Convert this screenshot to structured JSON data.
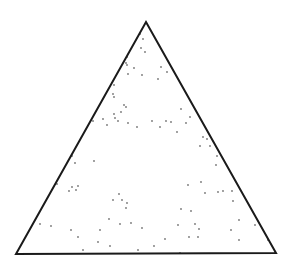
{
  "diagram": {
    "type": "triangle-scatter",
    "background": "#ffffff",
    "stroke_color": "#1a1a1a",
    "dot_color": "#777777",
    "triangle": {
      "apex": [
        146,
        22
      ],
      "left": [
        16,
        254
      ],
      "right": [
        276,
        253
      ]
    },
    "points": [
      [
        140,
        34
      ],
      [
        143,
        39
      ],
      [
        141,
        48
      ],
      [
        145,
        52
      ],
      [
        127,
        57
      ],
      [
        127,
        65
      ],
      [
        126,
        63
      ],
      [
        134,
        68
      ],
      [
        128,
        74
      ],
      [
        142,
        75
      ],
      [
        161,
        67
      ],
      [
        167,
        72
      ],
      [
        158,
        79
      ],
      [
        114,
        85
      ],
      [
        113,
        94
      ],
      [
        114,
        97
      ],
      [
        124,
        105
      ],
      [
        126,
        107
      ],
      [
        121,
        112
      ],
      [
        114,
        114
      ],
      [
        115,
        118
      ],
      [
        93,
        121
      ],
      [
        103,
        119
      ],
      [
        107,
        125
      ],
      [
        118,
        121
      ],
      [
        128,
        123
      ],
      [
        137,
        127
      ],
      [
        152,
        121
      ],
      [
        160,
        127
      ],
      [
        166,
        121
      ],
      [
        171,
        122
      ],
      [
        181,
        109
      ],
      [
        190,
        117
      ],
      [
        186,
        123
      ],
      [
        177,
        132
      ],
      [
        203,
        137
      ],
      [
        207,
        139
      ],
      [
        200,
        146
      ],
      [
        210,
        146
      ],
      [
        217,
        156
      ],
      [
        216,
        165
      ],
      [
        72,
        156
      ],
      [
        75,
        163
      ],
      [
        94,
        161
      ],
      [
        57,
        184
      ],
      [
        72,
        187
      ],
      [
        69,
        191
      ],
      [
        76,
        190
      ],
      [
        78,
        186
      ],
      [
        119,
        194
      ],
      [
        113,
        200
      ],
      [
        122,
        200
      ],
      [
        127,
        203
      ],
      [
        126,
        208
      ],
      [
        188,
        185
      ],
      [
        201,
        182
      ],
      [
        205,
        193
      ],
      [
        218,
        192
      ],
      [
        223,
        191
      ],
      [
        232,
        191
      ],
      [
        233,
        201
      ],
      [
        181,
        209
      ],
      [
        191,
        211
      ],
      [
        109,
        219
      ],
      [
        120,
        224
      ],
      [
        131,
        223
      ],
      [
        142,
        228
      ],
      [
        195,
        224
      ],
      [
        199,
        229
      ],
      [
        178,
        225
      ],
      [
        231,
        230
      ],
      [
        239,
        220
      ],
      [
        255,
        225
      ],
      [
        40,
        224
      ],
      [
        51,
        226
      ],
      [
        71,
        230
      ],
      [
        100,
        230
      ],
      [
        78,
        237
      ],
      [
        198,
        237
      ],
      [
        239,
        240
      ],
      [
        189,
        237
      ],
      [
        165,
        239
      ],
      [
        268,
        240
      ],
      [
        98,
        242
      ],
      [
        110,
        246
      ],
      [
        83,
        250
      ],
      [
        138,
        250
      ],
      [
        154,
        246
      ],
      [
        180,
        253
      ]
    ]
  }
}
